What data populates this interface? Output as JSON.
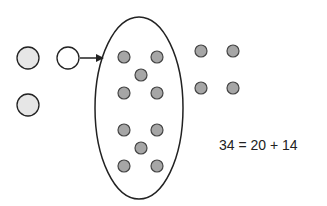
{
  "diagram": {
    "equation": "34 = 20 + 14",
    "colors": {
      "stroke": "#222222",
      "dot_fill": "#a6a6a6",
      "light_circle_fill": "#e6e6e6",
      "open_circle_fill": "#ffffff",
      "background": "#ffffff"
    },
    "left_circles": [
      {
        "cx": 28,
        "cy": 58,
        "r": 11,
        "style": "light"
      },
      {
        "cx": 68,
        "cy": 58,
        "r": 11,
        "style": "open"
      },
      {
        "cx": 28,
        "cy": 105,
        "r": 11,
        "style": "light"
      }
    ],
    "arrow": {
      "x1": 80,
      "y1": 58,
      "x2": 103,
      "y2": 58
    },
    "ellipse": {
      "cx": 139,
      "cy": 108,
      "rx": 44,
      "ry": 91
    },
    "ellipse_dots": [
      {
        "cx": 124,
        "cy": 57
      },
      {
        "cx": 157,
        "cy": 57
      },
      {
        "cx": 141,
        "cy": 75
      },
      {
        "cx": 124,
        "cy": 93
      },
      {
        "cx": 157,
        "cy": 93
      },
      {
        "cx": 124,
        "cy": 130
      },
      {
        "cx": 157,
        "cy": 130
      },
      {
        "cx": 141,
        "cy": 148
      },
      {
        "cx": 124,
        "cy": 166
      },
      {
        "cx": 157,
        "cy": 166
      }
    ],
    "right_dots": [
      {
        "cx": 201,
        "cy": 51
      },
      {
        "cx": 233,
        "cy": 51
      },
      {
        "cx": 201,
        "cy": 88
      },
      {
        "cx": 233,
        "cy": 88
      }
    ],
    "dot_radius": 6
  }
}
